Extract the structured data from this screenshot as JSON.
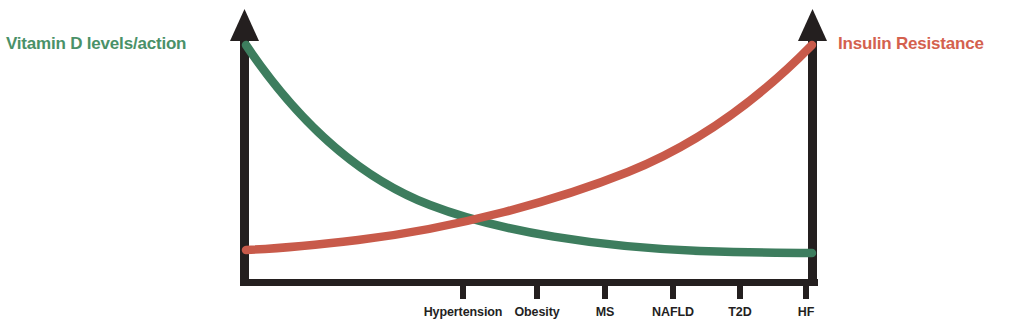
{
  "figure": {
    "background_color": "#ffffff",
    "axis_color": "#241f1f",
    "left_axis_label": "Vitamin D levels/action",
    "right_axis_label": "Insulin Resistance",
    "left_axis_label_color": "#4a9168",
    "right_axis_label_color": "#d4614e",
    "left_arrow_icon": "up-arrow-icon",
    "right_arrow_icon": "up-arrow-icon"
  },
  "chart_data": {
    "type": "line",
    "title": "",
    "xlabel": "",
    "ylabel": "",
    "categories": [
      "Hypertension",
      "Obesity",
      "MS",
      "NAFLD",
      "T2D",
      "HF"
    ],
    "x": [
      1,
      2,
      3,
      4,
      5,
      6
    ],
    "xlim": [
      0,
      7
    ],
    "ylim": [
      0,
      100
    ],
    "grid": false,
    "legend": "none",
    "annotations": [
      "Vitamin D levels/action decreases across disease severity",
      "Insulin Resistance increases across disease severity",
      "Curves cross between Obesity and MS"
    ],
    "series": [
      {
        "name": "Vitamin D levels/action",
        "color": "#3d7d5e",
        "axis": "left",
        "trend": "exponential-decay",
        "values": [
          72,
          50,
          34,
          22,
          15,
          12
        ],
        "endpoint_start": 98,
        "endpoint_end": 12
      },
      {
        "name": "Insulin Resistance",
        "color": "#c85a4a",
        "axis": "right",
        "trend": "exponential-growth",
        "values": [
          20,
          27,
          37,
          50,
          67,
          88
        ],
        "endpoint_start": 14,
        "endpoint_end": 98
      }
    ]
  },
  "ticks": [
    {
      "label": "Hypertension",
      "x": 463
    },
    {
      "label": "Obesity",
      "x": 537
    },
    {
      "label": "MS",
      "x": 605
    },
    {
      "label": "NAFLD",
      "x": 673
    },
    {
      "label": "T2D",
      "x": 740
    },
    {
      "label": "HF",
      "x": 806
    }
  ]
}
